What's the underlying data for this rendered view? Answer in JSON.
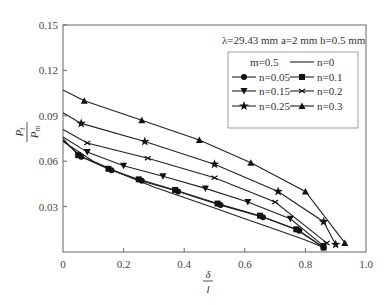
{
  "chart_data": {
    "type": "line",
    "title": "",
    "annotation": "λ=29.43 mm  a=2 mm  h=0.5 mm",
    "legend_header": "m=0.5",
    "xlabel": "δ / l",
    "ylabel": "P_t / P_m",
    "xlim": [
      0,
      1.0
    ],
    "ylim": [
      0,
      0.15
    ],
    "xticks": [
      "0",
      "0.2",
      "0.4",
      "0.6",
      "0.8",
      "1.0"
    ],
    "yticks": [
      "0.03",
      "0.06",
      "0.09",
      "0.12",
      "0.15"
    ],
    "grid": false,
    "legend_position": "upper right",
    "series": [
      {
        "name": "n=0",
        "marker": "none",
        "x": [
          0,
          0.1,
          0.2,
          0.3,
          0.4,
          0.5,
          0.6,
          0.7,
          0.8,
          0.86
        ],
        "y": [
          0.073,
          0.06,
          0.051,
          0.043,
          0.036,
          0.029,
          0.022,
          0.015,
          0.008,
          0.003
        ]
      },
      {
        "name": "n=0.05",
        "marker": "circle",
        "x": [
          0,
          0.06,
          0.16,
          0.26,
          0.38,
          0.52,
          0.66,
          0.78,
          0.86
        ],
        "y": [
          0.074,
          0.063,
          0.054,
          0.047,
          0.04,
          0.031,
          0.023,
          0.014,
          0.003
        ]
      },
      {
        "name": "n=0.1",
        "marker": "square",
        "x": [
          0,
          0.05,
          0.15,
          0.25,
          0.37,
          0.51,
          0.65,
          0.77,
          0.86
        ],
        "y": [
          0.075,
          0.064,
          0.055,
          0.048,
          0.041,
          0.032,
          0.024,
          0.015,
          0.003
        ]
      },
      {
        "name": "n=0.15",
        "marker": "triangle-down",
        "x": [
          0,
          0.08,
          0.2,
          0.33,
          0.47,
          0.61,
          0.75,
          0.86
        ],
        "y": [
          0.076,
          0.066,
          0.057,
          0.05,
          0.042,
          0.033,
          0.022,
          0.004
        ]
      },
      {
        "name": "n=0.2",
        "marker": "x-tick",
        "x": [
          0,
          0.08,
          0.28,
          0.5,
          0.7,
          0.87
        ],
        "y": [
          0.081,
          0.072,
          0.062,
          0.049,
          0.033,
          0.006
        ]
      },
      {
        "name": "n=0.25",
        "marker": "star",
        "x": [
          0,
          0.06,
          0.27,
          0.5,
          0.71,
          0.86,
          0.9
        ],
        "y": [
          0.092,
          0.085,
          0.073,
          0.058,
          0.04,
          0.02,
          0.005
        ]
      },
      {
        "name": "n=0.3",
        "marker": "triangle-up",
        "x": [
          0,
          0.07,
          0.26,
          0.45,
          0.62,
          0.8,
          0.93
        ],
        "y": [
          0.107,
          0.1,
          0.087,
          0.074,
          0.059,
          0.04,
          0.006
        ]
      }
    ]
  },
  "ui": {
    "annotation": "λ=29.43 mm  a=2 mm  h=0.5 mm",
    "legend_header": "m=0.5",
    "ylabel_num": "P",
    "ylabel_num_sub": "t",
    "ylabel_den": "P",
    "ylabel_den_sub": "m",
    "xlabel_num": "δ",
    "xlabel_den": "l"
  }
}
